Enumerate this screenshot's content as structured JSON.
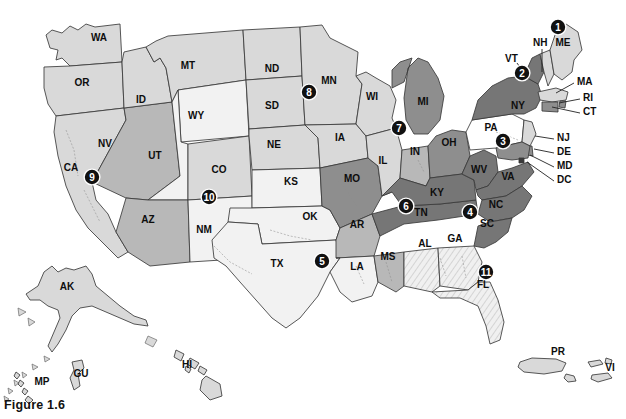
{
  "figure": {
    "caption": "Figure 1.6"
  },
  "map": {
    "title": "United States regional choropleth map",
    "background_color": "#ffffff",
    "border_color": "#3a3a3a",
    "shades": {
      "white": "#ffffff",
      "very_light": "#f2f2f2",
      "light": "#d9d9d9",
      "medium": "#b8b8b8",
      "dark": "#8e8e8e",
      "darker": "#767676",
      "hatch": "#e8e8e8"
    },
    "states": [
      {
        "code": "WA",
        "label": "WA",
        "x": 99,
        "y": 41,
        "shade": "light"
      },
      {
        "code": "OR",
        "label": "OR",
        "x": 82,
        "y": 86,
        "shade": "light"
      },
      {
        "code": "ID",
        "label": "ID",
        "x": 141,
        "y": 103,
        "shade": "light"
      },
      {
        "code": "MT",
        "label": "MT",
        "x": 188,
        "y": 69,
        "shade": "light"
      },
      {
        "code": "WY",
        "label": "WY",
        "x": 196,
        "y": 119,
        "shade": "very_light"
      },
      {
        "code": "ND",
        "label": "ND",
        "x": 272,
        "y": 72,
        "shade": "light"
      },
      {
        "code": "SD",
        "label": "SD",
        "x": 272,
        "y": 109,
        "shade": "light"
      },
      {
        "code": "NE",
        "label": "NE",
        "x": 274,
        "y": 148,
        "shade": "light"
      },
      {
        "code": "MN",
        "label": "MN",
        "x": 329,
        "y": 84,
        "shade": "light"
      },
      {
        "code": "WI",
        "label": "WI",
        "x": 372,
        "y": 100,
        "shade": "light"
      },
      {
        "code": "IA",
        "label": "IA",
        "x": 340,
        "y": 141,
        "shade": "light"
      },
      {
        "code": "MI",
        "label": "MI",
        "x": 423,
        "y": 105,
        "shade": "dark"
      },
      {
        "code": "IL",
        "label": "IL",
        "x": 383,
        "y": 164,
        "shade": "light"
      },
      {
        "code": "IN",
        "label": "IN",
        "x": 415,
        "y": 155,
        "shade": "medium"
      },
      {
        "code": "OH",
        "label": "OH",
        "x": 449,
        "y": 146,
        "shade": "dark"
      },
      {
        "code": "NV",
        "label": "NV",
        "x": 105,
        "y": 147,
        "shade": "medium"
      },
      {
        "code": "CA",
        "label": "CA",
        "x": 71,
        "y": 171,
        "shade": "light"
      },
      {
        "code": "UT",
        "label": "UT",
        "x": 155,
        "y": 159,
        "shade": "very_light"
      },
      {
        "code": "CO",
        "label": "CO",
        "x": 219,
        "y": 173,
        "shade": "light"
      },
      {
        "code": "AZ",
        "label": "AZ",
        "x": 148,
        "y": 223,
        "shade": "medium"
      },
      {
        "code": "NM",
        "label": "NM",
        "x": 204,
        "y": 233,
        "shade": "very_light"
      },
      {
        "code": "KS",
        "label": "KS",
        "x": 291,
        "y": 185,
        "shade": "very_light"
      },
      {
        "code": "OK",
        "label": "OK",
        "x": 310,
        "y": 220,
        "shade": "very_light"
      },
      {
        "code": "TX",
        "label": "TX",
        "x": 277,
        "y": 267,
        "shade": "very_light"
      },
      {
        "code": "MO",
        "label": "MO",
        "x": 352,
        "y": 182,
        "shade": "dark"
      },
      {
        "code": "AR",
        "label": "AR",
        "x": 357,
        "y": 228,
        "shade": "medium"
      },
      {
        "code": "LA",
        "label": "LA",
        "x": 357,
        "y": 270,
        "shade": "very_light"
      },
      {
        "code": "MS",
        "label": "MS",
        "x": 388,
        "y": 260,
        "shade": "medium"
      },
      {
        "code": "AL",
        "label": "AL",
        "x": 425,
        "y": 247,
        "shade": "hatch"
      },
      {
        "code": "GA",
        "label": "GA",
        "x": 455,
        "y": 242,
        "shade": "hatch"
      },
      {
        "code": "FL",
        "label": "FL",
        "x": 483,
        "y": 288,
        "shade": "hatch"
      },
      {
        "code": "TN",
        "label": "TN",
        "x": 421,
        "y": 216,
        "shade": "darker"
      },
      {
        "code": "KY",
        "label": "KY",
        "x": 437,
        "y": 196,
        "shade": "darker"
      },
      {
        "code": "WV",
        "label": "WV",
        "x": 479,
        "y": 173,
        "shade": "darker"
      },
      {
        "code": "VA",
        "label": "VA",
        "x": 508,
        "y": 180,
        "shade": "darker"
      },
      {
        "code": "NC",
        "label": "NC",
        "x": 496,
        "y": 208,
        "shade": "darker"
      },
      {
        "code": "SC",
        "label": "SC",
        "x": 487,
        "y": 227,
        "shade": "darker"
      },
      {
        "code": "PA",
        "label": "PA",
        "x": 491,
        "y": 131,
        "shade": "white"
      },
      {
        "code": "NY",
        "label": "NY",
        "x": 518,
        "y": 109,
        "shade": "darker"
      },
      {
        "code": "ME",
        "label": "ME",
        "x": 563,
        "y": 46,
        "shade": "light"
      },
      {
        "code": "AK",
        "label": "AK",
        "x": 67,
        "y": 290,
        "shade": "light"
      },
      {
        "code": "HI",
        "label": "HI",
        "x": 187,
        "y": 368,
        "shade": "light"
      },
      {
        "code": "GU",
        "label": "GU",
        "x": 81,
        "y": 377,
        "shade": "light"
      },
      {
        "code": "MP",
        "label": "MP",
        "x": 42,
        "y": 385,
        "shade": "light"
      },
      {
        "code": "PR",
        "label": "PR",
        "x": 558,
        "y": 355,
        "shade": "light"
      },
      {
        "code": "VI",
        "label": "VI",
        "x": 610,
        "y": 371,
        "shade": "light"
      }
    ],
    "callouts": [
      {
        "code": "VT",
        "label": "VT",
        "x": 505,
        "y": 62,
        "line": [
          [
            517,
            63
          ],
          [
            527,
            77
          ]
        ]
      },
      {
        "code": "NH",
        "label": "NH",
        "x": 533,
        "y": 46,
        "line": [
          [
            542,
            49
          ],
          [
            542,
            72
          ]
        ]
      },
      {
        "code": "MA",
        "label": "MA",
        "x": 577,
        "y": 85,
        "line": [
          [
            574,
            83
          ],
          [
            556,
            93
          ]
        ]
      },
      {
        "code": "RI",
        "label": "RI",
        "x": 583,
        "y": 101,
        "line": [
          [
            580,
            99
          ],
          [
            559,
            103
          ]
        ]
      },
      {
        "code": "CT",
        "label": "CT",
        "x": 583,
        "y": 115,
        "line": [
          [
            580,
            113
          ],
          [
            552,
            107
          ]
        ]
      },
      {
        "code": "NJ",
        "label": "NJ",
        "x": 557,
        "y": 141,
        "line": [
          [
            554,
            139
          ],
          [
            535,
            136
          ]
        ]
      },
      {
        "code": "DE",
        "label": "DE",
        "x": 557,
        "y": 155,
        "line": [
          [
            554,
            153
          ],
          [
            534,
            149
          ]
        ]
      },
      {
        "code": "MD",
        "label": "MD",
        "x": 557,
        "y": 169,
        "line": [
          [
            554,
            167
          ],
          [
            530,
            155
          ]
        ]
      },
      {
        "code": "DC",
        "label": "DC",
        "x": 557,
        "y": 183,
        "line": [
          [
            554,
            181
          ],
          [
            527,
            162
          ]
        ]
      }
    ],
    "markers": [
      {
        "number": "1",
        "x": 558,
        "y": 27
      },
      {
        "number": "2",
        "x": 522,
        "y": 73
      },
      {
        "number": "3",
        "x": 503,
        "y": 141
      },
      {
        "number": "4",
        "x": 470,
        "y": 212
      },
      {
        "number": "5",
        "x": 322,
        "y": 261
      },
      {
        "number": "6",
        "x": 406,
        "y": 206
      },
      {
        "number": "7",
        "x": 399,
        "y": 128
      },
      {
        "number": "8",
        "x": 309,
        "y": 92
      },
      {
        "number": "9",
        "x": 92,
        "y": 177
      },
      {
        "number": "10",
        "x": 209,
        "y": 197
      },
      {
        "number": "11",
        "x": 486,
        "y": 272
      }
    ]
  }
}
